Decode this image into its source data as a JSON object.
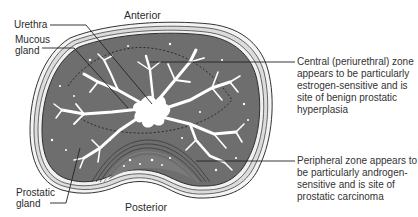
{
  "figure": {
    "orientation": {
      "top": "Anterior",
      "bottom": "Posterior"
    },
    "left_labels": [
      {
        "id": "urethra",
        "lines": [
          "Urethra"
        ]
      },
      {
        "id": "mucous-gland",
        "lines": [
          "Mucous",
          "gland"
        ]
      },
      {
        "id": "prostatic-gland",
        "lines": [
          "Prostatic",
          "gland"
        ]
      }
    ],
    "right_annotations": [
      {
        "id": "central-zone",
        "lines": [
          "Central (periurethral) zone",
          "appears to be particularly",
          "estrogen-sensitive and is",
          "site of benign prostatic",
          "hyperplasia"
        ]
      },
      {
        "id": "peripheral-zone",
        "lines": [
          "Peripheral zone appears to",
          "be particularly androgen-",
          "sensitive and is site of",
          "prostatic carcinoma"
        ]
      }
    ],
    "colors": {
      "tissue": "#6e6e6e",
      "capsule": "#f2f2f2",
      "outline": "#2e2e2e",
      "gland_lumen": "#ffffff",
      "leader_line": "#222222",
      "text": "#2b2b2b"
    }
  }
}
